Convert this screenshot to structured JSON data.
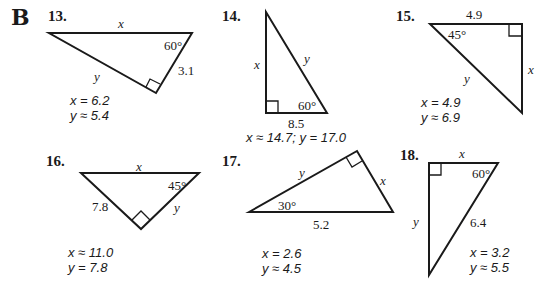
{
  "section": "B",
  "problems": [
    {
      "number": "13.",
      "labels": {
        "top": "x",
        "angle": "60°",
        "side": "3.1",
        "hyp": "y"
      },
      "answers": [
        "x = 6.2",
        "y ≈ 5.4"
      ]
    },
    {
      "number": "14.",
      "labels": {
        "left": "x",
        "hyp": "y",
        "angle": "60°",
        "bottom": "8.5"
      },
      "answers": [
        "x ≈ 14.7; y = 17.0"
      ]
    },
    {
      "number": "15.",
      "labels": {
        "top": "4.9",
        "angle": "45°",
        "right": "x",
        "hyp": "y"
      },
      "answers": [
        "x = 4.9",
        "y ≈ 6.9"
      ]
    },
    {
      "number": "16.",
      "labels": {
        "top": "x",
        "angle": "45°",
        "left": "7.8",
        "right": "y"
      },
      "answers": [
        "x ≈ 11.0",
        "y = 7.8"
      ]
    },
    {
      "number": "17.",
      "labels": {
        "upper": "y",
        "right": "x",
        "angle": "30°",
        "bottom": "5.2"
      },
      "answers": [
        "x = 2.6",
        "y ≈ 4.5"
      ]
    },
    {
      "number": "18.",
      "labels": {
        "top": "x",
        "angle": "60°",
        "left": "y",
        "hyp": "6.4"
      },
      "answers": [
        "x = 3.2",
        "y ≈ 5.5"
      ]
    }
  ]
}
